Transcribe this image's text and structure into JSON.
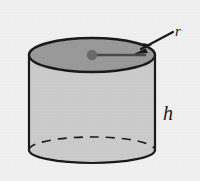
{
  "figure": {
    "background_color": "#f1f1f1",
    "stroke_color": "#1a1a1a",
    "body_fill": "#cccccc",
    "top_fill": "#9a9a9a",
    "dot_fill": "#6b6b6b",
    "shape": {
      "name": "cylinder",
      "center_x": 92,
      "radius_x": 63,
      "top_center_y": 55,
      "top_radius_y": 17,
      "bottom_center_y": 150,
      "bottom_radius_y": 13
    },
    "labels": [
      {
        "id": "radius-label",
        "text": "r",
        "x": 178,
        "y": 36,
        "meaning": "radius"
      },
      {
        "id": "height-label",
        "text": "h",
        "x": 168,
        "y": 120,
        "meaning": "height"
      }
    ],
    "annotations": {
      "radius_line": {
        "name": "radius-segment",
        "from_x": 92,
        "from_y": 55,
        "to_x": 146,
        "to_y": 55
      },
      "center_dot": {
        "name": "center-point",
        "x": 92,
        "y": 55,
        "r": 5
      },
      "arrow": {
        "name": "radius-pointer-arrow",
        "tail_x": 173,
        "tail_y": 32,
        "head_x": 136,
        "head_y": 52
      },
      "hidden_edge": {
        "name": "hidden-back-arc",
        "style": "dashed"
      }
    }
  }
}
